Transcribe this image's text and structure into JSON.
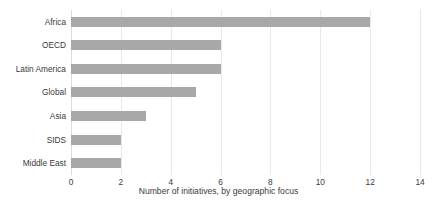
{
  "chart_data": {
    "type": "bar",
    "orientation": "horizontal",
    "title": "",
    "subtitle": "",
    "xlabel": "Number of initiatives, by geographic focus",
    "ylabel": "",
    "categories": [
      "Africa",
      "OECD",
      "Latin America",
      "Global",
      "Asia",
      "SIDS",
      "Middle East"
    ],
    "values": [
      12,
      6,
      6,
      5,
      3,
      2,
      2
    ],
    "xlim": [
      0,
      14
    ],
    "xticks": [
      0,
      2,
      4,
      6,
      8,
      10,
      12,
      14
    ],
    "xtick_labels": [
      "0",
      "2",
      "4",
      "6",
      "8",
      "10",
      "12",
      "14"
    ],
    "grid": "vertical",
    "legend": "none",
    "bar_color": "#a8a8a8",
    "gridline_color": "#e9e9e9",
    "text_color": "#3a3a3a",
    "background_color": "#ffffff"
  }
}
